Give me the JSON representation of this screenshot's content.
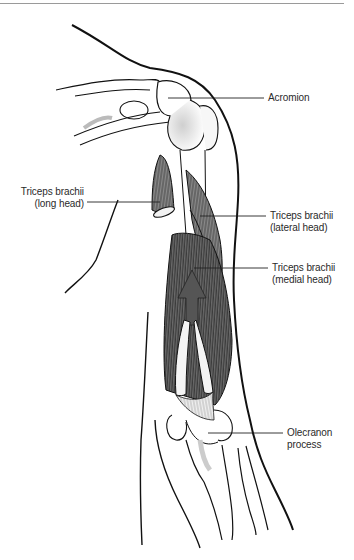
{
  "figure": {
    "labels": [
      {
        "id": "acromion",
        "lines": [
          "Acromion"
        ]
      },
      {
        "id": "triceps-long-head",
        "lines": [
          "Triceps brachii",
          "(long head)"
        ]
      },
      {
        "id": "triceps-lateral-head",
        "lines": [
          "Triceps brachii",
          "(lateral head)"
        ]
      },
      {
        "id": "triceps-medial-head",
        "lines": [
          "Triceps brachii",
          "(medial head)"
        ]
      },
      {
        "id": "olecranon-process",
        "lines": [
          "Olecranon",
          "process"
        ]
      }
    ]
  },
  "colors": {
    "ink": "#1a1a1a",
    "muscle_fill": "#7a7a7a",
    "muscle_dark": "#4a4a4a",
    "arrow_fill": "#555555",
    "text": "#2a2a2a",
    "rule": "#9a9a9a"
  }
}
